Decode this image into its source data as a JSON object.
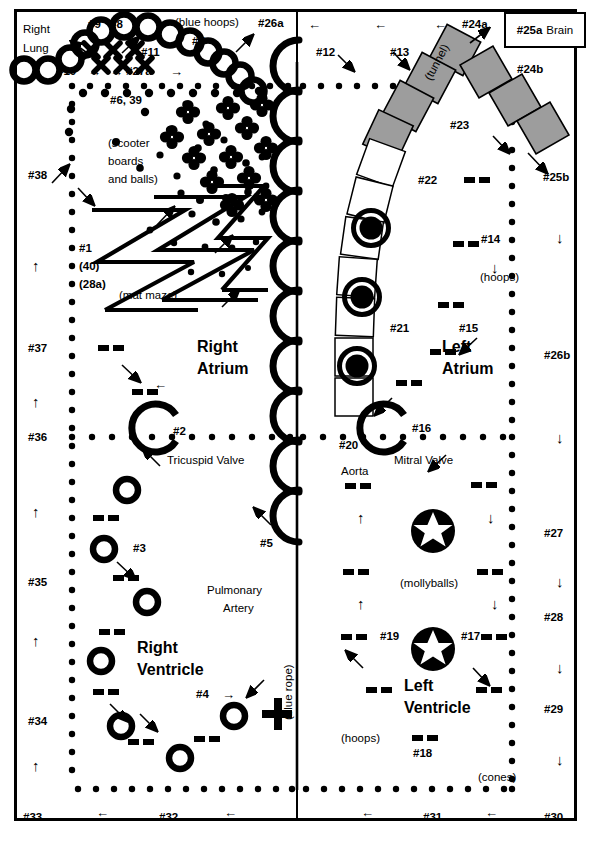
{
  "regions": {
    "right_atrium": "Right\nAtrium",
    "right_atrium_l1": "Right",
    "right_atrium_l2": "Atrium",
    "left_atrium_l1": "Left",
    "left_atrium_l2": "Atrium",
    "right_ventricle_l1": "Right",
    "right_ventricle_l2": "Ventricle",
    "left_ventricle_l1": "Left",
    "left_ventricle_l2": "Ventricle",
    "right_lung_l1": "Right",
    "right_lung_l2": "Lung"
  },
  "anatomy_labels": {
    "tricuspid_valve": "Tricuspid Valve",
    "mitral_valve": "Mitral Valve",
    "pulmonary_artery_l1": "Pulmonary",
    "pulmonary_artery_l2": "Artery",
    "aorta": "Aorta"
  },
  "equipment_notes": {
    "blue_hoops": "(blue hoops)",
    "scooter_l1": "(scooter",
    "scooter_l2": "boards",
    "scooter_l3": "and balls)",
    "mat_maze": "(mat maze)",
    "blue_rope": "(blue rope)",
    "tunnel": "(tunnel)",
    "hoops_left": "(hoops)",
    "hoops_right": "(hoops)",
    "mollyballs": "(mollyballs)",
    "cones": "(cones)"
  },
  "station_tags": {
    "s1": "#1",
    "s1b": "(40)",
    "s1c": "(28a)",
    "s2": "#2",
    "s3": "#3",
    "s4": "#4",
    "s5": "#5",
    "s6_39": "#6, 39",
    "s7": "#7",
    "s8": "#8",
    "s9": "#9",
    "s10": "#10",
    "s11": "#11",
    "s12": "#12",
    "s13": "#13",
    "s14": "#14",
    "s15": "#15",
    "s16": "#16",
    "s17": "#17",
    "s18": "#18",
    "s19": "#19",
    "s20": "#20",
    "s21": "#21",
    "s22": "#22",
    "s23": "#23",
    "s24a": "#24a",
    "s24b": "#24b",
    "s25a": "#25a",
    "s25a_word": "Brain",
    "s25b": "#25b",
    "s26a": "#26a",
    "s26b": "#26b",
    "s27": "#27",
    "s27a": "#27a",
    "s28": "#28",
    "s29": "#29",
    "s30": "#30",
    "s31": "#31",
    "s32": "#32",
    "s33": "#33",
    "s34": "#34",
    "s35": "#35",
    "s36": "#36",
    "s37": "#37",
    "s38": "#38"
  },
  "arrows": {
    "up": "↑",
    "down": "↓",
    "left": "←",
    "right": "→"
  },
  "colors": {
    "ink": "#000000",
    "paper": "#ffffff",
    "tunnel_fill": "#9d9d9d"
  }
}
